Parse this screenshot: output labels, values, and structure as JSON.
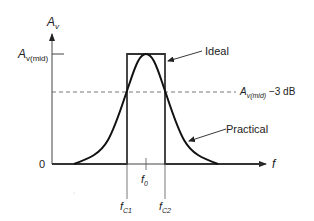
{
  "diagram": {
    "type": "bandpass-frequency-response",
    "colors": {
      "stroke": "#222222",
      "guide": "#555555",
      "background": "#ffffff"
    },
    "y_axis": {
      "label_main": "A",
      "label_sub": "v"
    },
    "x_axis": {
      "label": "f",
      "origin_label": "0"
    },
    "levels": {
      "mid_main": "A",
      "mid_sub": "v(mid)",
      "minus3db_main": "A",
      "minus3db_sub": "v(mid)",
      "minus3db_suffix": " −3 dB"
    },
    "frequencies": {
      "f0_main": "f",
      "f0_sub": "0",
      "fc1_main": "f",
      "fc1_sub": "C1",
      "fc2_main": "f",
      "fc2_sub": "C2"
    },
    "curves": {
      "ideal_label": "Ideal",
      "practical_label": "Practical"
    }
  }
}
